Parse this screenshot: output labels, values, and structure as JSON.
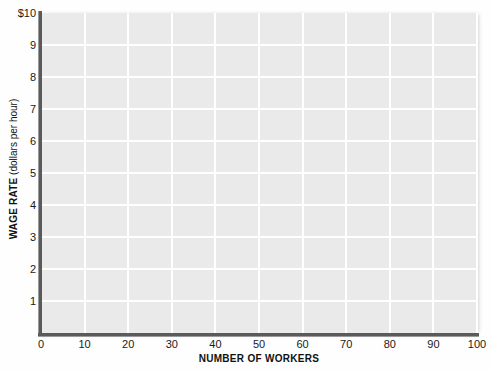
{
  "chart_data": {
    "type": "line",
    "title": "",
    "subtitle": "",
    "xlabel": "NUMBER OF WORKERS",
    "ylabel_bold": "WAGE RATE",
    "ylabel_regular": "(dollars per hour)",
    "ylabel": "WAGE RATE (dollars per hour)",
    "xlim": [
      0,
      100
    ],
    "ylim": [
      0,
      10
    ],
    "x_ticks": [
      0,
      10,
      20,
      30,
      40,
      50,
      60,
      70,
      80,
      90,
      100
    ],
    "x_tick_labels": [
      "0",
      "10",
      "20",
      "30",
      "40",
      "50",
      "60",
      "70",
      "80",
      "90",
      "100"
    ],
    "y_ticks": [
      1,
      2,
      3,
      4,
      5,
      6,
      7,
      8,
      9,
      10
    ],
    "y_tick_labels": [
      "1",
      "2",
      "3",
      "4",
      "5",
      "6",
      "7",
      "8",
      "9",
      "$10"
    ],
    "x_step": 10,
    "y_step": 1,
    "grid": true,
    "grid_color": "#ffffff",
    "plot_background": "#eaeaea",
    "page_background": "#fefefe",
    "axis_color": "#5a5a5a",
    "text_color": "#111111",
    "legend": [],
    "series": [],
    "annotations": [],
    "note": "Empty labeled grid; no data plotted"
  }
}
